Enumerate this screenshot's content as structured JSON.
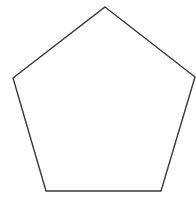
{
  "diagram": {
    "shape": "pentagon",
    "points": "105,7 195,77 161,191 46,191 13,78",
    "stroke": "#3a3a3a",
    "stroke_width": "1.4",
    "fill": "#ffffff"
  }
}
